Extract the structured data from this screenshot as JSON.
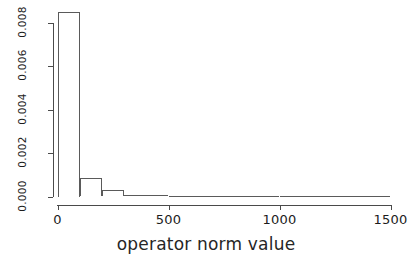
{
  "chart_data": {
    "type": "bar",
    "title": "",
    "subtitle": "",
    "xlabel": "operator norm value",
    "ylabel": "",
    "xlim": [
      0,
      1500
    ],
    "ylim": [
      0,
      0.0085
    ],
    "grid": false,
    "legend": null,
    "bin_width": 100,
    "x_ticks": [
      {
        "value": 0,
        "label": "0"
      },
      {
        "value": 500,
        "label": "500"
      },
      {
        "value": 1000,
        "label": "1000"
      },
      {
        "value": 1500,
        "label": "1500"
      }
    ],
    "y_ticks": [
      {
        "value": 0.0,
        "label": "0.000"
      },
      {
        "value": 0.002,
        "label": "0.002"
      },
      {
        "value": 0.004,
        "label": "0.004"
      },
      {
        "value": 0.006,
        "label": "0.006"
      },
      {
        "value": 0.008,
        "label": "0.008"
      }
    ],
    "bins": [
      {
        "x0": 0,
        "x1": 100,
        "density": 0.0085
      },
      {
        "x0": 100,
        "x1": 200,
        "density": 0.00085
      },
      {
        "x0": 200,
        "x1": 300,
        "density": 0.00028
      },
      {
        "x0": 300,
        "x1": 400,
        "density": 7e-05
      },
      {
        "x0": 400,
        "x1": 500,
        "density": 5e-05
      },
      {
        "x0": 500,
        "x1": 600,
        "density": 2e-05
      },
      {
        "x0": 600,
        "x1": 700,
        "density": 2e-05
      },
      {
        "x0": 700,
        "x1": 800,
        "density": 1e-05
      },
      {
        "x0": 800,
        "x1": 900,
        "density": 1e-05
      },
      {
        "x0": 900,
        "x1": 1000,
        "density": 1e-05
      },
      {
        "x0": 1000,
        "x1": 1100,
        "density": 0.0
      },
      {
        "x0": 1100,
        "x1": 1200,
        "density": 1e-05
      },
      {
        "x0": 1200,
        "x1": 1300,
        "density": 0.0
      },
      {
        "x0": 1300,
        "x1": 1400,
        "density": 0.0
      },
      {
        "x0": 1400,
        "x1": 1500,
        "density": 0.0
      }
    ],
    "categories": [
      "0-100",
      "100-200",
      "200-300",
      "300-400",
      "400-500",
      "500-600",
      "600-700",
      "700-800",
      "800-900",
      "900-1000",
      "1000-1100",
      "1100-1200",
      "1200-1300",
      "1300-1400",
      "1400-1500"
    ],
    "values": [
      0.0085,
      0.00085,
      0.00028,
      7e-05,
      5e-05,
      2e-05,
      2e-05,
      1e-05,
      1e-05,
      1e-05,
      0.0,
      1e-05,
      0.0,
      0.0,
      0.0
    ],
    "colors": {
      "bar_stroke": "#5a5a5a",
      "bar_fill": "transparent",
      "axis": "#4a4a4a",
      "text": "#1c1c1c",
      "background": "#ffffff"
    }
  }
}
